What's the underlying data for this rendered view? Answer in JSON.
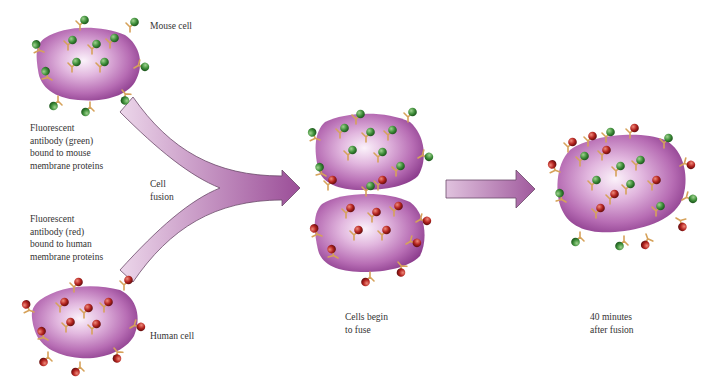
{
  "figure": {
    "colors": {
      "membrane_light": "#f5e8f3",
      "membrane_mid": "#c27ec0",
      "membrane_dark": "#8e3f8f",
      "arrow_light": "#e6cde4",
      "arrow_dark": "#9b4e98",
      "arrow_outline": "#6b4a6a",
      "green_antibody": "#3f8f3a",
      "red_antibody": "#b3231f",
      "antibody_stem": "#d6a25a",
      "text": "#333333"
    }
  },
  "labels": {
    "mouse_cell": "Mouse cell",
    "human_cell": "Human cell",
    "green_antibody": "Fluorescent\nantibody (green)\nbound to mouse\nmembrane proteins",
    "red_antibody": "Fluorescent\nantibody (red)\nbound to human\nmembrane proteins",
    "cell_fusion": "Cell\nfusion",
    "cells_begin": "Cells begin\nto fuse",
    "after_fusion": "40 minutes\nafter fusion"
  }
}
